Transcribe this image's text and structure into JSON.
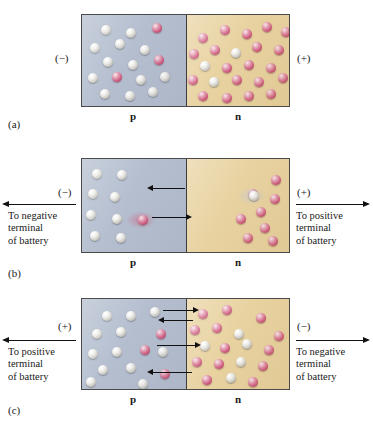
{
  "figure": {
    "colors": {
      "p_region": "#b4becf",
      "n_region": "#e8d2a0",
      "hole_sphere": "#e8e6e0",
      "electron_sphere": "#cf5f80",
      "border": "#4a4a4a",
      "background": "#ffffff"
    }
  },
  "panels": [
    {
      "id": "a",
      "sublabel": "(a)",
      "left_polarity": "(−)",
      "right_polarity": "(+)",
      "p_label": "p",
      "n_label": "n",
      "terminal_left_text": "",
      "terminal_right_text": "",
      "has_leads": false,
      "junction_arrows": []
    },
    {
      "id": "b",
      "sublabel": "(b)",
      "left_polarity": "(−)",
      "right_polarity": "(+)",
      "p_label": "p",
      "n_label": "n",
      "terminal_left_text": "To negative\nterminal\nof battery",
      "terminal_right_text": "To positive\nterminal\nof battery",
      "has_leads": true,
      "junction_arrows": [
        "left",
        "right"
      ]
    },
    {
      "id": "c",
      "sublabel": "(c)",
      "left_polarity": "(+)",
      "right_polarity": "(−)",
      "p_label": "p",
      "n_label": "n",
      "terminal_left_text": "To positive\nterminal\nof battery",
      "terminal_right_text": "To negative\nterminal\nof battery",
      "has_leads": true,
      "junction_arrows": [
        "right",
        "left",
        "right",
        "left"
      ]
    }
  ],
  "spheres": {
    "a_p": [
      {
        "x": 19,
        "y": 10,
        "t": "hole"
      },
      {
        "x": 44,
        "y": 13,
        "t": "hole"
      },
      {
        "x": 70,
        "y": 8,
        "t": "electron"
      },
      {
        "x": 8,
        "y": 28,
        "t": "hole"
      },
      {
        "x": 33,
        "y": 24,
        "t": "hole"
      },
      {
        "x": 58,
        "y": 30,
        "t": "hole"
      },
      {
        "x": 21,
        "y": 42,
        "t": "hole"
      },
      {
        "x": 46,
        "y": 45,
        "t": "hole"
      },
      {
        "x": 72,
        "y": 40,
        "t": "electron"
      },
      {
        "x": 6,
        "y": 58,
        "t": "hole"
      },
      {
        "x": 30,
        "y": 57,
        "t": "electron"
      },
      {
        "x": 54,
        "y": 60,
        "t": "hole"
      },
      {
        "x": 78,
        "y": 57,
        "t": "hole"
      },
      {
        "x": 18,
        "y": 74,
        "t": "hole"
      },
      {
        "x": 43,
        "y": 76,
        "t": "hole"
      },
      {
        "x": 66,
        "y": 72,
        "t": "hole"
      }
    ],
    "a_n": [
      {
        "x": 12,
        "y": 18,
        "t": "electron"
      },
      {
        "x": 34,
        "y": 10,
        "t": "electron"
      },
      {
        "x": 56,
        "y": 14,
        "t": "electron"
      },
      {
        "x": 76,
        "y": 7,
        "t": "electron"
      },
      {
        "x": 95,
        "y": 12,
        "t": "electron"
      },
      {
        "x": 3,
        "y": 34,
        "t": "electron"
      },
      {
        "x": 24,
        "y": 30,
        "t": "electron"
      },
      {
        "x": 45,
        "y": 33,
        "t": "hole"
      },
      {
        "x": 66,
        "y": 27,
        "t": "electron"
      },
      {
        "x": 88,
        "y": 30,
        "t": "electron"
      },
      {
        "x": 14,
        "y": 46,
        "t": "hole"
      },
      {
        "x": 36,
        "y": 48,
        "t": "electron"
      },
      {
        "x": 58,
        "y": 45,
        "t": "electron"
      },
      {
        "x": 80,
        "y": 48,
        "t": "electron"
      },
      {
        "x": 2,
        "y": 60,
        "t": "electron"
      },
      {
        "x": 23,
        "y": 62,
        "t": "hole"
      },
      {
        "x": 46,
        "y": 60,
        "t": "electron"
      },
      {
        "x": 68,
        "y": 62,
        "t": "electron"
      },
      {
        "x": 92,
        "y": 58,
        "t": "electron"
      },
      {
        "x": 12,
        "y": 76,
        "t": "electron"
      },
      {
        "x": 36,
        "y": 78,
        "t": "electron"
      },
      {
        "x": 58,
        "y": 76,
        "t": "electron"
      },
      {
        "x": 80,
        "y": 74,
        "t": "electron"
      }
    ],
    "b_p": [
      {
        "x": 10,
        "y": 10,
        "t": "hole"
      },
      {
        "x": 35,
        "y": 11,
        "t": "hole"
      },
      {
        "x": 6,
        "y": 30,
        "t": "hole"
      },
      {
        "x": 28,
        "y": 33,
        "t": "hole"
      },
      {
        "x": 4,
        "y": 51,
        "t": "hole"
      },
      {
        "x": 30,
        "y": 55,
        "t": "hole"
      },
      {
        "x": 8,
        "y": 72,
        "t": "hole"
      },
      {
        "x": 34,
        "y": 74,
        "t": "hole"
      }
    ],
    "b_n": [
      {
        "x": 85,
        "y": 16,
        "t": "electron"
      },
      {
        "x": 62,
        "y": 30,
        "t": "electron"
      },
      {
        "x": 84,
        "y": 35,
        "t": "electron"
      },
      {
        "x": 70,
        "y": 48,
        "t": "electron"
      },
      {
        "x": 50,
        "y": 55,
        "t": "electron"
      },
      {
        "x": 74,
        "y": 64,
        "t": "electron"
      },
      {
        "x": 57,
        "y": 74,
        "t": "electron"
      },
      {
        "x": 82,
        "y": 77,
        "t": "electron"
      }
    ],
    "b_moving": [
      {
        "x": 63,
        "y": 32,
        "t": "hole",
        "zone": "n"
      },
      {
        "x": 56,
        "y": 56,
        "t": "electron",
        "zone": "p"
      }
    ],
    "c_p": [
      {
        "x": 20,
        "y": 12,
        "t": "hole"
      },
      {
        "x": 44,
        "y": 12,
        "t": "hole"
      },
      {
        "x": 68,
        "y": 8,
        "t": "hole"
      },
      {
        "x": 10,
        "y": 30,
        "t": "hole"
      },
      {
        "x": 34,
        "y": 28,
        "t": "hole"
      },
      {
        "x": 74,
        "y": 30,
        "t": "electron"
      },
      {
        "x": 6,
        "y": 50,
        "t": "hole"
      },
      {
        "x": 30,
        "y": 48,
        "t": "hole"
      },
      {
        "x": 58,
        "y": 46,
        "t": "electron"
      },
      {
        "x": 76,
        "y": 48,
        "t": "hole"
      },
      {
        "x": 16,
        "y": 66,
        "t": "hole"
      },
      {
        "x": 44,
        "y": 64,
        "t": "hole"
      },
      {
        "x": 4,
        "y": 78,
        "t": "hole"
      },
      {
        "x": 56,
        "y": 80,
        "t": "hole"
      },
      {
        "x": 78,
        "y": 70,
        "t": "electron"
      }
    ],
    "c_n": [
      {
        "x": 12,
        "y": 10,
        "t": "electron"
      },
      {
        "x": 36,
        "y": 6,
        "t": "electron"
      },
      {
        "x": 70,
        "y": 14,
        "t": "electron"
      },
      {
        "x": 4,
        "y": 26,
        "t": "electron"
      },
      {
        "x": 26,
        "y": 24,
        "t": "electron"
      },
      {
        "x": 48,
        "y": 30,
        "t": "hole"
      },
      {
        "x": 88,
        "y": 32,
        "t": "electron"
      },
      {
        "x": 14,
        "y": 42,
        "t": "hole"
      },
      {
        "x": 34,
        "y": 44,
        "t": "electron"
      },
      {
        "x": 56,
        "y": 40,
        "t": "hole"
      },
      {
        "x": 78,
        "y": 46,
        "t": "electron"
      },
      {
        "x": 6,
        "y": 58,
        "t": "electron"
      },
      {
        "x": 28,
        "y": 60,
        "t": "electron"
      },
      {
        "x": 50,
        "y": 58,
        "t": "hole"
      },
      {
        "x": 72,
        "y": 62,
        "t": "electron"
      },
      {
        "x": 16,
        "y": 76,
        "t": "electron"
      },
      {
        "x": 40,
        "y": 74,
        "t": "hole"
      },
      {
        "x": 62,
        "y": 78,
        "t": "electron"
      }
    ]
  }
}
